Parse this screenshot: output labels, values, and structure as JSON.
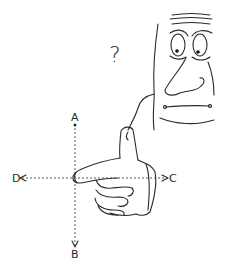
{
  "illustration": {
    "question_mark": "?",
    "axis_labels": {
      "top": "A",
      "bottom": "B",
      "right": "C",
      "left": "D"
    },
    "ink_color": "#2a2a2a",
    "background": "#ffffff"
  }
}
